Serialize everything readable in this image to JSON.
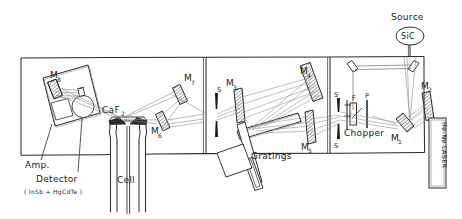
{
  "figure": {
    "ink_color": "#2b2b2b",
    "beam_color": "#8a8a8a",
    "background": "#ffffff"
  },
  "labels": {
    "source_text": "Source",
    "source_material": "SiC",
    "laser": "He-Ne LASER",
    "mirror1": "M",
    "mirror1_sub": "1",
    "mirror2": "M",
    "mirror2_sub": "2",
    "mirror3": "M",
    "mirror3_sub": "3",
    "mirror4": "M",
    "mirror4_sub": "4",
    "mirror5": "M",
    "mirror5_sub": "5",
    "mirror6": "M",
    "mirror6_sub": "6",
    "mirror7": "M",
    "mirror7_sub": "7",
    "mirror8": "M",
    "mirror8_sub": "8",
    "slit_entrance": "S",
    "slit_mid_upper": "S",
    "slit_mid_lower": "S",
    "filter": "F",
    "polarizer": "P",
    "chopper": "Chopper",
    "gratings": "Gratings",
    "window": "CaF",
    "window_sub": "2",
    "cell": "Cell",
    "amplifier": "Amp.",
    "detector": "Detector",
    "detector_materials": "( InSb + HgCdTe )"
  },
  "components": [
    {
      "name": "sic-source",
      "label": "SiC",
      "kind": "source"
    },
    {
      "name": "he-ne-laser",
      "label": "He-Ne LASER",
      "kind": "laser"
    },
    {
      "name": "mirror-m1",
      "label": "M1",
      "kind": "curved-mirror"
    },
    {
      "name": "mirror-m2",
      "label": "M2",
      "kind": "curved-mirror"
    },
    {
      "name": "mirror-m3",
      "label": "M3",
      "kind": "curved-mirror"
    },
    {
      "name": "mirror-m4",
      "label": "M4",
      "kind": "curved-mirror"
    },
    {
      "name": "mirror-m5",
      "label": "M5",
      "kind": "curved-mirror"
    },
    {
      "name": "mirror-m6",
      "label": "M6",
      "kind": "curved-mirror"
    },
    {
      "name": "mirror-m7",
      "label": "M7",
      "kind": "curved-mirror"
    },
    {
      "name": "mirror-m8",
      "label": "M8",
      "kind": "curved-mirror"
    },
    {
      "name": "flat-mirror-top-left",
      "label": "",
      "kind": "flat-mirror"
    },
    {
      "name": "flat-mirror-top-right",
      "label": "",
      "kind": "flat-mirror"
    },
    {
      "name": "slit-entrance",
      "label": "S",
      "kind": "slit"
    },
    {
      "name": "slit-mid-upper",
      "label": "S",
      "kind": "slit"
    },
    {
      "name": "slit-mid-lower",
      "label": "S",
      "kind": "slit"
    },
    {
      "name": "filter-f",
      "label": "F",
      "kind": "filter"
    },
    {
      "name": "polarizer-p",
      "label": "P",
      "kind": "polarizer"
    },
    {
      "name": "chopper-wheel",
      "label": "Chopper",
      "kind": "chopper"
    },
    {
      "name": "grating-turret",
      "label": "Gratings",
      "kind": "grating"
    },
    {
      "name": "sample-cell",
      "label": "Cell",
      "kind": "cell"
    },
    {
      "name": "caf2-windows",
      "label": "CaF2",
      "kind": "window"
    },
    {
      "name": "detector-unit",
      "label": "Detector",
      "kind": "detector"
    },
    {
      "name": "amplifier-unit",
      "label": "Amp.",
      "kind": "amplifier"
    }
  ]
}
